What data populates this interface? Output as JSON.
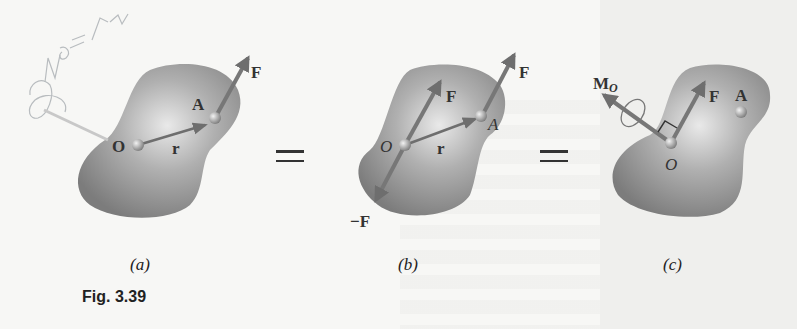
{
  "figure": {
    "number_label": "Fig. 3.39",
    "panels": [
      {
        "id": "a",
        "caption": "(a)",
        "labels": {
          "force": "F",
          "point_A": "A",
          "point_O": "O",
          "position_vector": "r"
        },
        "handwriting": "ΣM_O = Σ m"
      },
      {
        "id": "b",
        "caption": "(b)",
        "labels": {
          "force_at_A": "F",
          "force_at_O": "F",
          "neg_force": "−F",
          "point_A": "A",
          "point_O": "O",
          "position_vector": "r"
        }
      },
      {
        "id": "c",
        "caption": "(c)",
        "labels": {
          "moment": "M",
          "moment_sub": "O",
          "force": "F",
          "point_A": "A",
          "point_O": "O"
        }
      }
    ],
    "equals_symbol": "=",
    "colors": {
      "body_fill": "#8a8a8a",
      "body_highlight": "#e6e6e6",
      "arrow": "#6e6e6e",
      "text": "#333333",
      "background": "#f7f7f5"
    }
  }
}
